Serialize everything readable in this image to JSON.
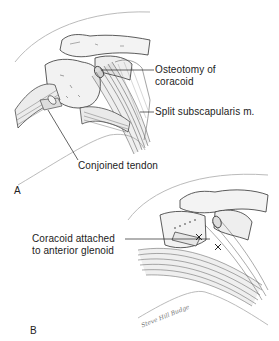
{
  "figure": {
    "panels": [
      {
        "letter": "A",
        "labels": [
          {
            "line1": "Osteotomy of",
            "line2": "coracoid"
          },
          {
            "line1": "Split subscapularis m."
          },
          {
            "line1": "Conjoined tendon"
          }
        ]
      },
      {
        "letter": "B",
        "labels": [
          {
            "line1": "Coracoid attached",
            "line2": "to anterior glenoid"
          }
        ]
      }
    ],
    "signature": "Steve Hill Budge",
    "colors": {
      "ink": "#222222",
      "shade": "#888888",
      "light": "#cccccc",
      "background": "#ffffff"
    }
  }
}
